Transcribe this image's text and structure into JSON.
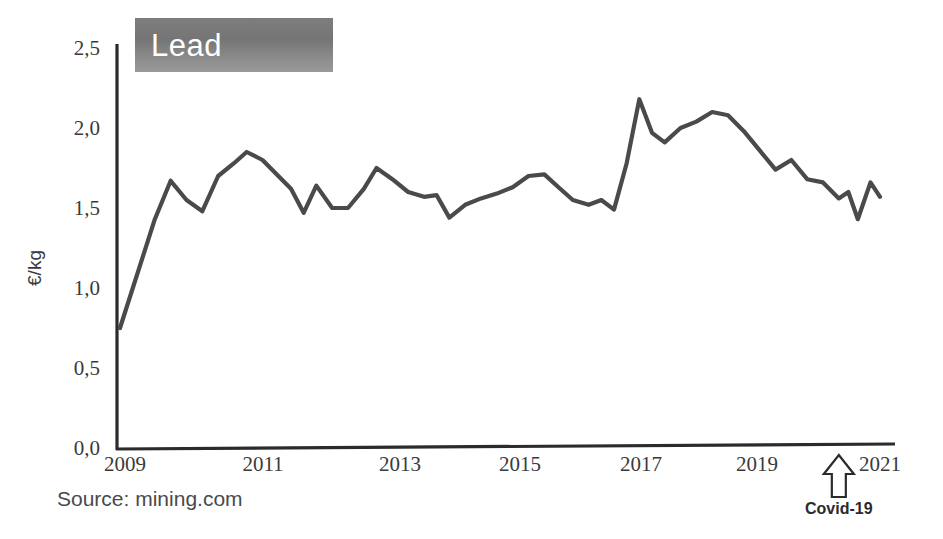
{
  "chart_data": {
    "type": "line",
    "title": "Lead",
    "xlabel": "",
    "ylabel": "€/kg",
    "xlim": [
      2009,
      2021.2
    ],
    "ylim": [
      0.0,
      2.5
    ],
    "grid": false,
    "legend": "none",
    "y_ticks": [
      "0,0",
      "0,5",
      "1,0",
      "1,5",
      "2,0",
      "2,5"
    ],
    "y_tick_values": [
      0.0,
      0.5,
      1.0,
      1.5,
      2.0,
      2.5
    ],
    "x_ticks": [
      "2009",
      "2011",
      "2013",
      "2015",
      "2017",
      "2019",
      "2021"
    ],
    "x_tick_values": [
      2009,
      2011,
      2013,
      2015,
      2017,
      2019,
      2021
    ],
    "series": [
      {
        "name": "Lead price",
        "color": "#4a4a4a",
        "x": [
          2009.0,
          2009.55,
          2009.8,
          2010.05,
          2010.3,
          2010.55,
          2010.8,
          2011.0,
          2011.25,
          2011.5,
          2011.7,
          2011.9,
          2012.1,
          2012.35,
          2012.6,
          2012.85,
          2013.05,
          2013.3,
          2013.55,
          2013.8,
          2014.0,
          2014.2,
          2014.45,
          2014.7,
          2014.95,
          2015.2,
          2015.45,
          2015.7,
          2015.95,
          2016.15,
          2016.4,
          2016.6,
          2016.8,
          2017.0,
          2017.2,
          2017.4,
          2017.6,
          2017.85,
          2018.1,
          2018.35,
          2018.6,
          2018.85,
          2019.1,
          2019.35,
          2019.6,
          2019.85,
          2020.1,
          2020.35,
          2020.5,
          2020.65,
          2020.85,
          2021.0
        ],
        "y": [
          0.75,
          1.43,
          1.67,
          1.55,
          1.48,
          1.7,
          1.78,
          1.85,
          1.8,
          1.7,
          1.62,
          1.47,
          1.64,
          1.5,
          1.5,
          1.62,
          1.75,
          1.68,
          1.6,
          1.57,
          1.58,
          1.44,
          1.52,
          1.56,
          1.59,
          1.63,
          1.7,
          1.71,
          1.62,
          1.55,
          1.52,
          1.55,
          1.49,
          1.78,
          2.18,
          1.97,
          1.91,
          2.0,
          2.04,
          2.1,
          2.08,
          1.98,
          1.86,
          1.74,
          1.8,
          1.68,
          1.66,
          1.56,
          1.6,
          1.43,
          1.66,
          1.57
        ]
      }
    ],
    "annotations": [
      {
        "name": "covid-arrow",
        "label": "Covid-19",
        "x": 2020.35,
        "shape": "up-arrow-outline"
      }
    ],
    "source": "Source: mining.com"
  },
  "banner": {
    "label": "Lead",
    "background_from": "#7d7d7d",
    "background_to": "#9a9a9a",
    "text_color": "#ffffff"
  },
  "axes": {
    "axis_color": "#2b2b2b",
    "label_color": "#3a3a3a"
  }
}
